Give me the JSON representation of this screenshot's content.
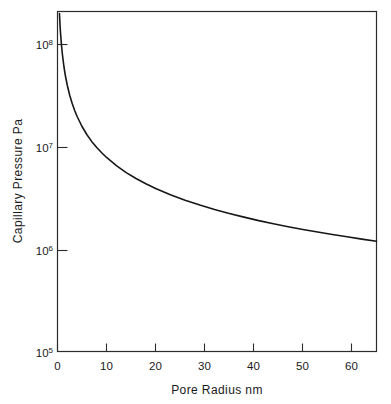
{
  "chart_data": {
    "type": "line",
    "title": "",
    "subtitle": "",
    "xlabel": "Pore Radius nm",
    "ylabel": "Capillary Pressure Pa",
    "xlim": [
      0,
      65
    ],
    "ylim": [
      100000,
      200000000
    ],
    "yscale": "log",
    "xscale": "linear",
    "grid": false,
    "legend": false,
    "legend_position": "none",
    "x_ticks": [
      0,
      10,
      20,
      30,
      40,
      50,
      60
    ],
    "x_tick_labels": [
      "0",
      "10",
      "20",
      "30",
      "40",
      "50",
      "60"
    ],
    "y_ticks": [
      100000,
      1000000,
      10000000,
      100000000
    ],
    "y_tick_labels": [
      "10⁵",
      "10⁶",
      "10⁷",
      "10⁸"
    ],
    "y_tick_mantissas": [
      "10",
      "10",
      "10",
      "10"
    ],
    "y_tick_exponents": [
      "5",
      "6",
      "7",
      "8"
    ],
    "annotations": [],
    "series": [
      {
        "name": "Capillary pressure",
        "color": "#171717",
        "x": [
          0.4,
          0.5,
          0.6,
          0.8,
          1.0,
          1.3,
          1.6,
          2.0,
          2.5,
          3.0,
          3.5,
          4.0,
          5.0,
          6.0,
          7.0,
          8.0,
          9.0,
          10.0,
          12.0,
          14.0,
          16.0,
          18.0,
          20.0,
          23.0,
          26.0,
          29.0,
          32.0,
          35.0,
          38.0,
          41.0,
          44.0,
          47.0,
          50.0,
          53.0,
          56.0,
          59.0,
          62.0,
          65.0
        ],
        "y": [
          200000000,
          160000000,
          133000000,
          100000000,
          80000000,
          61500000,
          50000000,
          40000000,
          32000000,
          26700000,
          22900000,
          20000000,
          16000000,
          13300000,
          11400000,
          10000000,
          8890000,
          8000000,
          6670000,
          5710000,
          5000000,
          4440000,
          4000000,
          3480000,
          3080000,
          2760000,
          2500000,
          2290000,
          2110000,
          1950000,
          1820000,
          1700000,
          1600000,
          1510000,
          1430000,
          1360000,
          1290000,
          1230000
        ]
      }
    ]
  },
  "axes": {
    "x_axis_name": "pore-radius-axis",
    "y_axis_name": "capillary-pressure-axis"
  },
  "colors": {
    "background": "#ffffff",
    "frame": "#2b2b2b",
    "curve": "#171717",
    "text": "#1a1a1a"
  }
}
